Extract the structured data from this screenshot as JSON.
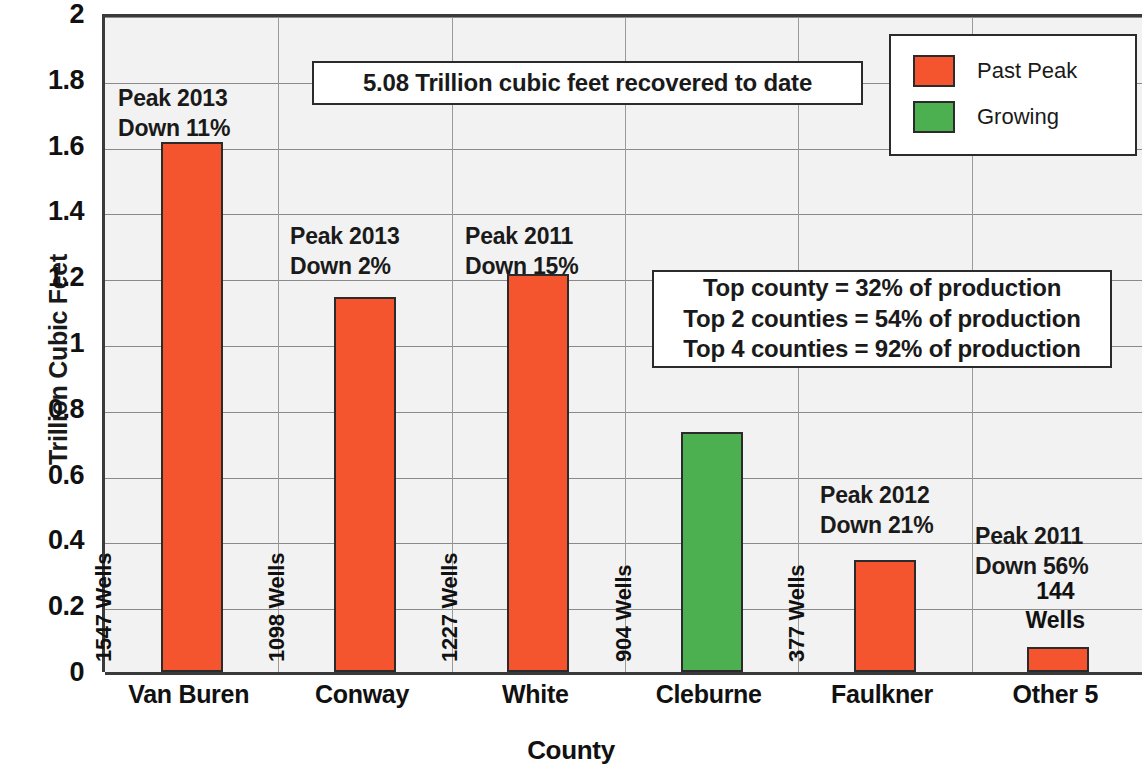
{
  "chart_data": {
    "type": "bar",
    "title": "",
    "xlabel": "County",
    "ylabel": "Trillion Cubic Feet",
    "ylim": [
      0,
      2
    ],
    "ytick_labels": [
      "2",
      "1.8",
      "1.6",
      "1.4",
      "1.2",
      "1",
      "0.8",
      "0.6",
      "0.4",
      "0.2",
      "0"
    ],
    "ytick_values": [
      2,
      1.8,
      1.6,
      1.4,
      1.2,
      1,
      0.8,
      0.6,
      0.4,
      0.2,
      0
    ],
    "grid": true,
    "legend_position": "top-right",
    "categories": [
      "Van Buren",
      "Conway",
      "White",
      "Cleburne",
      "Faulkner",
      "Other 5"
    ],
    "values": [
      1.61,
      1.14,
      1.21,
      0.73,
      0.34,
      0.075
    ],
    "series": [
      {
        "name": "Production",
        "values": [
          1.61,
          1.14,
          1.21,
          0.73,
          0.34,
          0.075
        ],
        "point_categories": [
          "Past Peak",
          "Past Peak",
          "Past Peak",
          "Growing",
          "Past Peak",
          "Past Peak"
        ]
      }
    ],
    "bar_value_labels": [
      "1547 Wells",
      "1098 Wells",
      "1227 Wells",
      "904 Wells",
      "377 Wells",
      "144 Wells"
    ],
    "wells": [
      1547,
      1098,
      1227,
      904,
      377,
      144
    ],
    "annotations": [
      {
        "category": "Van Buren",
        "line1": "Peak 2013",
        "line2": "Down 11%"
      },
      {
        "category": "Conway",
        "line1": "Peak 2013",
        "line2": "Down 2%"
      },
      {
        "category": "White",
        "line1": "Peak 2011",
        "line2": "Down 15%"
      },
      {
        "category": "Faulkner",
        "line1": "Peak 2012",
        "line2": "Down 21%"
      },
      {
        "category": "Other 5",
        "line1": "Peak 2011",
        "line2": "Down 56%"
      }
    ],
    "textboxes": {
      "recovered": "5.08 Trillion cubic feet recovered to date",
      "production": [
        "Top county = 32% of production",
        "Top 2 counties = 54% of production",
        "Top 4 counties = 92% of production"
      ]
    },
    "legend": [
      {
        "label": "Past Peak",
        "color": "#F4552E"
      },
      {
        "label": "Growing",
        "color": "#4CAF50"
      }
    ],
    "colors": {
      "past_peak": "#F4552E",
      "growing": "#4CAF50",
      "plot_background": "#f2f2f2",
      "gridline": "#8a8a8a",
      "axis": "#3a3a3a",
      "text": "#111111"
    }
  }
}
